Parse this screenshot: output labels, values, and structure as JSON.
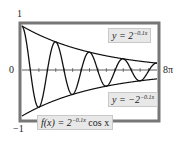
{
  "chart_data": {
    "type": "line",
    "title": "",
    "xlabel": "",
    "ylabel": "",
    "xlim": [
      0,
      25.1327
    ],
    "ylim": [
      -1,
      1
    ],
    "x_tick_labels": {
      "left": "0",
      "right": "8π"
    },
    "y_tick_labels": {
      "top": "1",
      "bottom": "-1"
    },
    "grid": false,
    "series": [
      {
        "name": "f(x) = 2^(-0.1x) cos x",
        "formula": "2^(-0.1*x)*cos(x)"
      },
      {
        "name": "y = 2^(-0.1x)",
        "formula": "2^(-0.1*x)"
      },
      {
        "name": "y = -2^(-0.1x)",
        "formula": "-2^(-0.1*x)"
      }
    ],
    "annotations": [
      {
        "text": "y = 2^(-0.1x)",
        "target": "upper envelope"
      },
      {
        "text": "y = -2^(-0.1x)",
        "target": "lower envelope"
      },
      {
        "text": "f(x) = 2^(-0.1x) cos x",
        "target": "damped oscillation"
      }
    ]
  },
  "labels": {
    "y_top": "1",
    "y_bottom": "−1",
    "x_left": "0",
    "x_right": "8π",
    "upper_base": "y = 2",
    "upper_exp": "−0.1x",
    "lower_base": "y = −2",
    "lower_exp": "−0.1x",
    "f_base": "f(x) = 2",
    "f_exp": "−0.1x",
    "f_tail": " cos x"
  }
}
